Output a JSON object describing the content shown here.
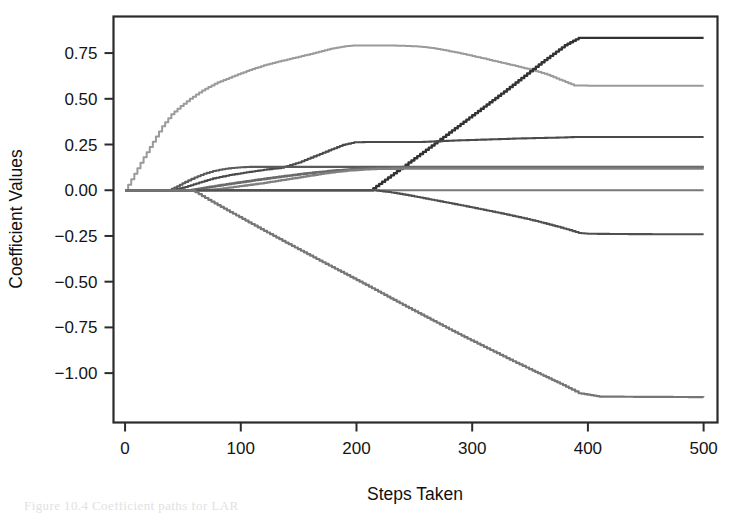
{
  "figure": {
    "background_color": "#ffffff",
    "frame_color": "#2b2b2b",
    "caption_partial": "Figure 10.4  Coefficient paths for LAR"
  },
  "chart_data": {
    "type": "line",
    "title": "",
    "xlabel": "Steps Taken",
    "ylabel": "Coefficient Values",
    "xlim": [
      -10,
      512
    ],
    "ylim": [
      -1.27,
      0.95
    ],
    "xticks": [
      0,
      100,
      200,
      300,
      400,
      500
    ],
    "xticklabels": [
      "0",
      "100",
      "200",
      "300",
      "400",
      "500"
    ],
    "yticks": [
      0.75,
      0.5,
      0.25,
      0.0,
      -0.25,
      -0.5,
      -0.75,
      -1.0
    ],
    "yticklabels": [
      "0.75",
      "0.50",
      "0.25",
      "0.00",
      "-0.25",
      "-0.50",
      "-0.75",
      "-1.00"
    ],
    "grid": false,
    "legend": "none",
    "series": [
      {
        "name": "path-1-rises-peaks-then-drops",
        "color": "#9a9a9a",
        "width": 2.0,
        "final_value": 0.57,
        "peak_value": 0.79,
        "x": [
          0,
          8,
          16,
          24,
          32,
          40,
          48,
          56,
          64,
          72,
          80,
          90,
          100,
          110,
          120,
          130,
          140,
          150,
          160,
          170,
          180,
          190,
          197,
          210,
          225,
          240,
          255,
          265,
          275,
          290,
          305,
          320,
          335,
          350,
          365,
          378,
          388,
          400,
          430,
          470,
          500
        ],
        "y": [
          0.0,
          0.09,
          0.18,
          0.265,
          0.35,
          0.415,
          0.46,
          0.5,
          0.535,
          0.565,
          0.59,
          0.615,
          0.64,
          0.663,
          0.683,
          0.7,
          0.715,
          0.73,
          0.745,
          0.762,
          0.777,
          0.788,
          0.792,
          0.792,
          0.792,
          0.79,
          0.785,
          0.778,
          0.767,
          0.748,
          0.727,
          0.705,
          0.683,
          0.66,
          0.632,
          0.598,
          0.573,
          0.572,
          0.571,
          0.571,
          0.571
        ]
      },
      {
        "name": "path-2-steep-late-riser",
        "color": "#323232",
        "width": 2.4,
        "final_value": 0.83,
        "x": [
          0,
          60,
          120,
          180,
          212,
          240,
          270,
          300,
          330,
          360,
          380,
          392,
          410,
          450,
          500
        ],
        "y": [
          0.0,
          0.0,
          0.0,
          0.0,
          0.0,
          0.128,
          0.268,
          0.41,
          0.552,
          0.7,
          0.793,
          0.833,
          0.833,
          0.833,
          0.833
        ]
      },
      {
        "name": "path-3-mid-riser-plateau-029",
        "color": "#4a4a4a",
        "width": 2.1,
        "final_value": 0.29,
        "x": [
          0,
          40,
          52,
          64,
          76,
          90,
          105,
          120,
          135,
          150,
          163,
          176,
          188,
          198,
          210,
          230,
          255,
          270,
          285,
          300,
          320,
          340,
          360,
          375,
          388,
          400,
          440,
          500
        ],
        "y": [
          0.0,
          0.0,
          0.018,
          0.042,
          0.065,
          0.083,
          0.098,
          0.112,
          0.123,
          0.152,
          0.185,
          0.218,
          0.248,
          0.262,
          0.264,
          0.264,
          0.264,
          0.268,
          0.272,
          0.275,
          0.279,
          0.283,
          0.286,
          0.288,
          0.291,
          0.291,
          0.291,
          0.291
        ]
      },
      {
        "name": "path-4-early-riser-plateau-013",
        "color": "#5a5a5a",
        "width": 2.1,
        "final_value": 0.128,
        "x": [
          0,
          38,
          45,
          52,
          60,
          68,
          76,
          84,
          92,
          100,
          110,
          125,
          160,
          200,
          250,
          300,
          350,
          400,
          450,
          500
        ],
        "y": [
          0.0,
          0.0,
          0.022,
          0.046,
          0.07,
          0.09,
          0.105,
          0.115,
          0.122,
          0.126,
          0.128,
          0.128,
          0.128,
          0.128,
          0.128,
          0.128,
          0.128,
          0.128,
          0.128,
          0.128
        ]
      },
      {
        "name": "path-5-gradual-riser-plateau-0125",
        "color": "#6a6a6a",
        "width": 2.6,
        "final_value": 0.125,
        "x": [
          0,
          55,
          66,
          78,
          90,
          102,
          115,
          128,
          140,
          152,
          165,
          178,
          190,
          205,
          220,
          240,
          270,
          310,
          360,
          420,
          500
        ],
        "y": [
          0.0,
          0.0,
          0.011,
          0.023,
          0.035,
          0.046,
          0.058,
          0.069,
          0.079,
          0.089,
          0.098,
          0.106,
          0.112,
          0.118,
          0.122,
          0.125,
          0.125,
          0.125,
          0.125,
          0.125,
          0.125
        ]
      },
      {
        "name": "path-6-stepped-riser-plateau-0118",
        "color": "#808080",
        "width": 2.3,
        "final_value": 0.118,
        "x": [
          0,
          70,
          82,
          94,
          106,
          118,
          130,
          142,
          152,
          162,
          172,
          182,
          192,
          205,
          220,
          245,
          280,
          330,
          400,
          500
        ],
        "y": [
          0.0,
          0.0,
          0.008,
          0.018,
          0.028,
          0.038,
          0.05,
          0.062,
          0.072,
          0.082,
          0.092,
          0.1,
          0.107,
          0.113,
          0.117,
          0.118,
          0.118,
          0.118,
          0.118,
          0.118
        ]
      },
      {
        "name": "path-7-flat-at-zero",
        "color": "#777777",
        "width": 2.0,
        "final_value": 0.0,
        "x": [
          0,
          100,
          200,
          300,
          400,
          500
        ],
        "y": [
          0.0,
          0.0,
          0.0,
          0.0,
          0.0,
          0.0
        ]
      },
      {
        "name": "path-8-declines-to-neg024",
        "color": "#505050",
        "width": 2.1,
        "final_value": -0.24,
        "x": [
          0,
          215,
          230,
          245,
          260,
          275,
          290,
          305,
          320,
          335,
          350,
          362,
          374,
          384,
          392,
          400,
          440,
          500
        ],
        "y": [
          0.0,
          0.0,
          -0.012,
          -0.028,
          -0.046,
          -0.064,
          -0.082,
          -0.101,
          -0.12,
          -0.14,
          -0.161,
          -0.18,
          -0.2,
          -0.218,
          -0.234,
          -0.238,
          -0.24,
          -0.241
        ]
      },
      {
        "name": "path-9-steep-decline-to-neg113",
        "color": "#767676",
        "width": 2.2,
        "final_value": -1.13,
        "x": [
          0,
          58,
          72,
          88,
          104,
          120,
          136,
          152,
          168,
          184,
          200,
          216,
          232,
          248,
          264,
          280,
          296,
          310,
          324,
          338,
          352,
          364,
          376,
          386,
          392,
          410,
          450,
          500
        ],
        "y": [
          0.0,
          0.0,
          -0.053,
          -0.11,
          -0.166,
          -0.222,
          -0.277,
          -0.331,
          -0.385,
          -0.438,
          -0.491,
          -0.545,
          -0.6,
          -0.654,
          -0.707,
          -0.76,
          -0.812,
          -0.856,
          -0.9,
          -0.944,
          -0.986,
          -1.022,
          -1.058,
          -1.09,
          -1.11,
          -1.128,
          -1.13,
          -1.131
        ]
      }
    ]
  },
  "axes": {
    "x_axis_name": "steps-taken-axis",
    "y_axis_name": "coefficient-values-axis"
  }
}
